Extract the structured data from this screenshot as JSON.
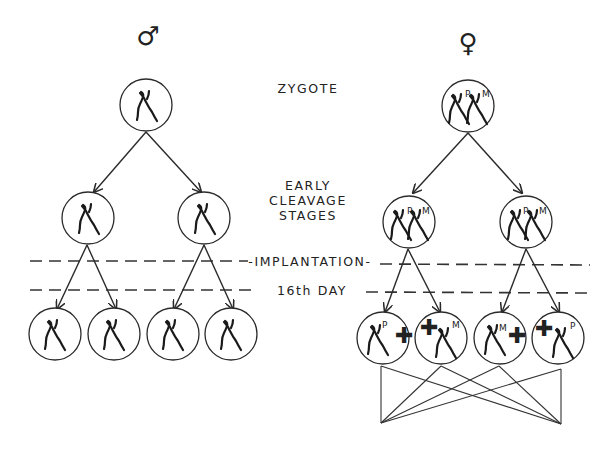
{
  "diagram": {
    "symbols": {
      "male": "♂",
      "female": "♀"
    },
    "stages": {
      "zygote": "ZYGOTE",
      "early1": "EARLY",
      "early2": "CLEAVAGE",
      "early3": "STAGES",
      "implantation": "-IMPLANTATION-",
      "day16": "16th DAY"
    },
    "markers": {
      "paternal": "P",
      "maternal": "M",
      "inactive": "✚"
    },
    "female_final_cells": [
      {
        "active_x": "P",
        "inactive_side": "right"
      },
      {
        "active_x": "M",
        "inactive_side": "left"
      },
      {
        "active_x": "M",
        "inactive_side": "right"
      },
      {
        "active_x": "P",
        "inactive_side": "left"
      }
    ]
  }
}
